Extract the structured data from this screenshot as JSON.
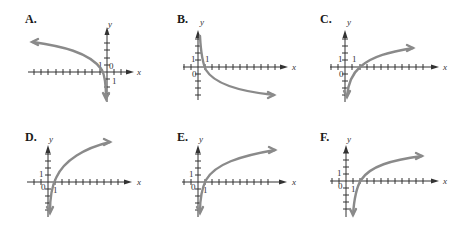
{
  "panels": [
    {
      "label": "A.",
      "x_axis_label": "x",
      "y_axis_label": "y",
      "origin_label": "0",
      "unit_x_label": "1",
      "unit_y_label": "1",
      "description": "Decreasing curve from upper left, crossing x-axis just left of origin, plunging down near y-axis"
    },
    {
      "label": "B.",
      "x_axis_label": "x",
      "y_axis_label": "y",
      "origin_label": "0",
      "unit_x_label": "1",
      "unit_y_label": "1",
      "description": "Decreasing curve from top near y-axis, crossing x-axis at x=1, leveling to lower right"
    },
    {
      "label": "C.",
      "x_axis_label": "x",
      "y_axis_label": "y",
      "origin_label": "0",
      "unit_x_label": "1",
      "unit_y_label": "1",
      "description": "Increasing curve from bottom near y-axis, crossing x-axis at x=2, rising to upper right"
    },
    {
      "label": "D.",
      "x_axis_label": "x",
      "y_axis_label": "y",
      "origin_label": "0",
      "unit_x_label": "1",
      "unit_y_label": "1",
      "description": "Increasing curve crossing x-axis at x=1, rising to upper right"
    },
    {
      "label": "E.",
      "x_axis_label": "x",
      "y_axis_label": "y",
      "origin_label": "0",
      "unit_x_label": "1",
      "unit_y_label": "1",
      "description": "Increasing curve crossing x-axis at x=1, rising more gently to upper right"
    },
    {
      "label": "F.",
      "x_axis_label": "x",
      "y_axis_label": "y",
      "origin_label": "0",
      "unit_x_label": "1",
      "unit_y_label": "1",
      "description": "Increasing curve with asymptote at x=1, crossing x-axis at x=2, rising to upper right"
    }
  ],
  "colors": {
    "curve": "#8a8a8a",
    "axis": "#333333"
  }
}
